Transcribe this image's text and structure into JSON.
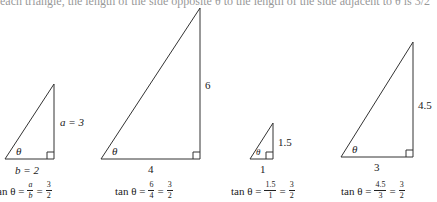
{
  "header_fragment": "each triangle, the length of the side opposite θ to the length of the side adjacent to θ is 3/2",
  "stroke_color": "#333333",
  "triangles": [
    {
      "id": "t1",
      "opposite_label": "a = 3",
      "adjacent_label": "b = 2",
      "angle_label": "θ",
      "formula": {
        "prefix": "tan θ =",
        "f1_num": "a",
        "f1_den": "b",
        "eq": "=",
        "f2_num": "3",
        "f2_den": "2"
      }
    },
    {
      "id": "t2",
      "opposite_label": "6",
      "adjacent_label": "4",
      "angle_label": "θ",
      "formula": {
        "prefix": "tan θ =",
        "f1_num": "6",
        "f1_den": "4",
        "eq": "=",
        "f2_num": "3",
        "f2_den": "2"
      }
    },
    {
      "id": "t3",
      "opposite_label": "1.5",
      "adjacent_label": "1",
      "angle_label": "θ",
      "formula": {
        "prefix": "tan θ =",
        "f1_num": "1.5",
        "f1_den": "1",
        "eq": "=",
        "f2_num": "3",
        "f2_den": "2"
      }
    },
    {
      "id": "t4",
      "opposite_label": "4.5",
      "adjacent_label": "3",
      "angle_label": "θ",
      "formula": {
        "prefix": "tan θ =",
        "f1_num": "4.5",
        "f1_den": "3",
        "eq": "=",
        "f2_num": "3",
        "f2_den": "2"
      }
    }
  ]
}
